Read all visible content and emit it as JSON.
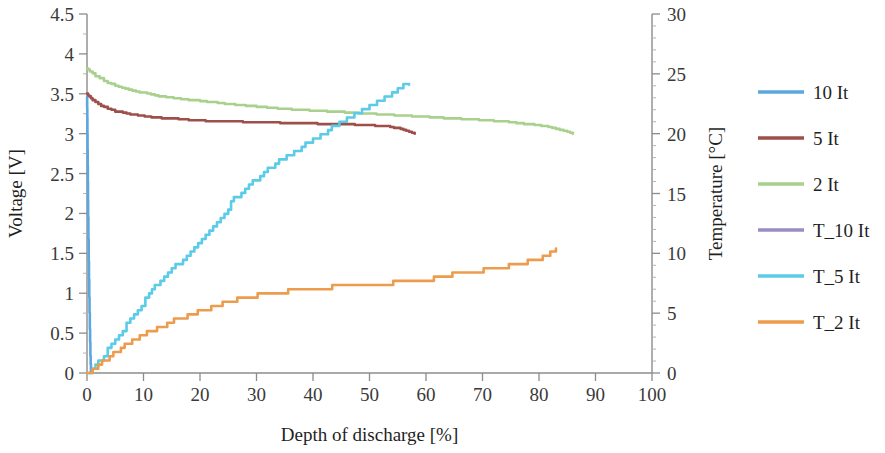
{
  "chart_data": {
    "type": "line",
    "title": "",
    "xlabel": "Depth of discharge [%]",
    "ylabel": "Voltage [V]",
    "y2label": "Temperature [°C]",
    "xlim": [
      0,
      100
    ],
    "ylim": [
      0,
      4.5
    ],
    "y2lim": [
      0,
      30
    ],
    "grid": false,
    "legend_position": "right",
    "xticks": [
      "0",
      "10",
      "20",
      "30",
      "40",
      "50",
      "60",
      "70",
      "80",
      "90",
      "100"
    ],
    "yticks": [
      "0",
      "0.5",
      "1",
      "1.5",
      "2",
      "2.5",
      "3",
      "3.5",
      "4",
      "4.5"
    ],
    "y2ticks": [
      "0",
      "5",
      "10",
      "15",
      "20",
      "25",
      "30"
    ],
    "series": [
      {
        "name": "10 It",
        "color": "#5BA8DE",
        "axis": "left",
        "unit": "V",
        "x": [
          0.0,
          0.05,
          0.1,
          0.15,
          0.2,
          0.3,
          0.4,
          0.5,
          0.6,
          0.7
        ],
        "values": [
          3.45,
          3.2,
          2.8,
          2.4,
          1.95,
          1.4,
          0.95,
          0.55,
          0.22,
          0.0
        ]
      },
      {
        "name": "5 It",
        "color": "#9E4F4A",
        "axis": "left",
        "unit": "V",
        "x": [
          0.0,
          0.4,
          1.0,
          2.0,
          3.0,
          5.0,
          7.0,
          9.0,
          12.0,
          15.0,
          18.0,
          21.0,
          24.0,
          27.0,
          30.0,
          33.0,
          36.0,
          39.0,
          42.0,
          45.0,
          48.0,
          51.0,
          53.0,
          55.0,
          56.0,
          57.0,
          58.0
        ],
        "values": [
          3.5,
          3.47,
          3.42,
          3.37,
          3.33,
          3.28,
          3.25,
          3.23,
          3.2,
          3.19,
          3.17,
          3.16,
          3.15,
          3.15,
          3.14,
          3.14,
          3.13,
          3.13,
          3.12,
          3.12,
          3.11,
          3.1,
          3.09,
          3.07,
          3.05,
          3.02,
          3.0
        ]
      },
      {
        "name": "2 It",
        "color": "#A9D18E",
        "axis": "left",
        "unit": "V",
        "x": [
          0.0,
          0.5,
          1.5,
          3.0,
          5.0,
          8.0,
          12.0,
          16.0,
          20.0,
          25.0,
          30.0,
          35.0,
          40.0,
          45.0,
          50.0,
          55.0,
          60.0,
          65.0,
          70.0,
          74.0,
          78.0,
          81.0,
          83.0,
          85.0,
          86.0
        ],
        "values": [
          3.82,
          3.78,
          3.72,
          3.66,
          3.6,
          3.54,
          3.48,
          3.44,
          3.41,
          3.37,
          3.34,
          3.31,
          3.29,
          3.27,
          3.25,
          3.23,
          3.21,
          3.19,
          3.17,
          3.15,
          3.12,
          3.09,
          3.06,
          3.02,
          3.0
        ]
      },
      {
        "name": "T_10 It",
        "color": "#9B8CC4",
        "axis": "right",
        "unit": "°C",
        "x": [],
        "values": []
      },
      {
        "name": "T_5 It",
        "color": "#5BCBE8",
        "axis": "right",
        "unit": "°C",
        "x": [
          0.0,
          1.0,
          2.0,
          3.0,
          5.0,
          7.0,
          9.0,
          11.0,
          12.0,
          13.0,
          15.0,
          17.0,
          19.0,
          21.0,
          23.0,
          25.0,
          26.0,
          28.0,
          30.0,
          32.0,
          34.0,
          36.0,
          38.0,
          40.0,
          42.0,
          44.0,
          46.0,
          48.0,
          50.0,
          52.0,
          54.0,
          55.0,
          56.0,
          57.0
        ],
        "values": [
          0.0,
          0.3,
          0.9,
          1.5,
          2.8,
          4.1,
          5.4,
          6.5,
          7.4,
          7.6,
          8.6,
          9.6,
          10.6,
          11.6,
          12.6,
          13.8,
          14.6,
          15.4,
          16.2,
          17.0,
          17.7,
          18.3,
          18.9,
          19.5,
          20.1,
          20.7,
          21.2,
          21.8,
          22.3,
          22.9,
          23.4,
          23.8,
          24.0,
          24.1
        ]
      },
      {
        "name": "T_2 It",
        "color": "#ED9C4E",
        "axis": "right",
        "unit": "°C",
        "x": [
          0.0,
          1.0,
          2.0,
          4.0,
          6.0,
          8.0,
          10.0,
          13.0,
          16.0,
          19.0,
          22.0,
          24.0,
          26.0,
          29.0,
          32.0,
          35.0,
          38.0,
          41.0,
          44.0,
          47.0,
          50.0,
          53.0,
          56.0,
          59.0,
          62.0,
          64.0,
          66.0,
          69.0,
          72.0,
          74.0,
          76.0,
          78.0,
          80.0,
          82.0,
          83.0
        ],
        "values": [
          0.0,
          0.3,
          0.7,
          1.4,
          2.1,
          2.7,
          3.2,
          3.9,
          4.5,
          5.0,
          5.5,
          5.9,
          6.1,
          6.4,
          6.6,
          6.8,
          7.0,
          7.1,
          7.2,
          7.3,
          7.4,
          7.5,
          7.6,
          7.8,
          7.9,
          8.2,
          8.3,
          8.5,
          8.7,
          8.9,
          9.1,
          9.3,
          9.6,
          10.1,
          10.4
        ]
      }
    ]
  },
  "legend": {
    "items": [
      {
        "label": "10 It",
        "color": "#5BA8DE"
      },
      {
        "label": "5 It",
        "color": "#9E4F4A"
      },
      {
        "label": "2 It",
        "color": "#A9D18E"
      },
      {
        "label": "T_10 It",
        "color": "#9B8CC4"
      },
      {
        "label": "T_5 It",
        "color": "#5BCBE8"
      },
      {
        "label": "T_2 It",
        "color": "#ED9C4E"
      }
    ]
  },
  "axes": {
    "x_title": "Depth of discharge [%]",
    "y_title": "Voltage [V]",
    "y2_title": "Temperature [°C]"
  }
}
